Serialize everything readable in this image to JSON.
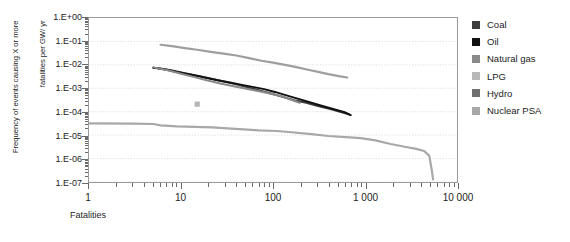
{
  "chart_data": {
    "type": "line",
    "title": "",
    "xlabel": "Fatalities",
    "ylabel": "Frequency of events causing X or more\nfatalities per GW/ yr",
    "xscale": "log",
    "yscale": "log",
    "xlim": [
      1,
      10000
    ],
    "ylim": [
      1e-07,
      1
    ],
    "xticklabels": [
      "1",
      "10",
      "100",
      "1 000",
      "10 000"
    ],
    "xtickvalues": [
      1,
      10,
      100,
      1000,
      10000
    ],
    "yticklabels": [
      "1.E+00",
      "1.E-01",
      "1.E-02",
      "1.E-03",
      "1.E-04",
      "1.E-05",
      "1.E-06",
      "1.E-07"
    ],
    "ytickvalues": [
      1,
      0.1,
      0.01,
      0.001,
      0.0001,
      1e-05,
      1e-06,
      1e-07
    ],
    "grid": true,
    "legend_position": "right",
    "series": [
      {
        "name": "Coal",
        "color": "#3d3d3d",
        "width": 2.0,
        "points": [
          [
            5,
            0.0075
          ],
          [
            6,
            0.007
          ],
          [
            8,
            0.0058
          ],
          [
            11,
            0.0044
          ],
          [
            16,
            0.0033
          ],
          [
            22,
            0.0025
          ],
          [
            30,
            0.0019
          ],
          [
            42,
            0.0014
          ],
          [
            55,
            0.00105
          ],
          [
            70,
            0.00082
          ],
          [
            95,
            0.0006
          ],
          [
            130,
            0.00042
          ],
          [
            170,
            0.00031
          ],
          [
            230,
            0.00024
          ],
          [
            300,
            0.00018
          ],
          [
            420,
            0.00013
          ],
          [
            560,
            9.5e-05
          ],
          [
            680,
            7.5e-05
          ]
        ]
      },
      {
        "name": "Oil",
        "color": "#111111",
        "width": 2.0,
        "points": [
          [
            5,
            0.0076
          ],
          [
            7,
            0.0062
          ],
          [
            9,
            0.005
          ],
          [
            13,
            0.0038
          ],
          [
            18,
            0.0029
          ],
          [
            25,
            0.0022
          ],
          [
            34,
            0.00175
          ],
          [
            46,
            0.0014
          ],
          [
            60,
            0.00115
          ],
          [
            80,
            0.00092
          ],
          [
            105,
            0.0007
          ],
          [
            140,
            0.0005
          ],
          [
            185,
            0.00036
          ],
          [
            245,
            0.00026
          ],
          [
            330,
            0.000185
          ],
          [
            450,
            0.00013
          ],
          [
            600,
            9.5e-05
          ],
          [
            700,
            7.2e-05
          ]
        ]
      },
      {
        "name": "Natural gas",
        "color": "#8a8a8a",
        "width": 2.0,
        "points": [
          [
            5,
            0.0078
          ],
          [
            7,
            0.006
          ],
          [
            10,
            0.0042
          ],
          [
            14,
            0.003
          ],
          [
            19,
            0.0022
          ],
          [
            26,
            0.00165
          ],
          [
            35,
            0.00128
          ],
          [
            48,
            0.001
          ],
          [
            62,
            0.00082
          ],
          [
            80,
            0.00068
          ],
          [
            100,
            0.00056
          ],
          [
            125,
            0.00046
          ],
          [
            150,
            0.00035
          ],
          [
            175,
            0.00028
          ],
          [
            195,
            0.00024
          ]
        ]
      },
      {
        "name": "LPG",
        "color": "#b3b3b3",
        "width": 2.0,
        "marker_only": true,
        "points": [
          [
            15,
            0.00021
          ]
        ]
      },
      {
        "name": "Hydro",
        "color": "#9e9e9e",
        "width": 2.2,
        "points": [
          [
            6,
            0.072
          ],
          [
            8,
            0.063
          ],
          [
            11,
            0.052
          ],
          [
            15,
            0.044
          ],
          [
            21,
            0.036
          ],
          [
            29,
            0.03
          ],
          [
            40,
            0.025
          ],
          [
            55,
            0.0195
          ],
          [
            75,
            0.015
          ],
          [
            100,
            0.0125
          ],
          [
            135,
            0.01
          ],
          [
            180,
            0.008
          ],
          [
            240,
            0.0062
          ],
          [
            310,
            0.005
          ],
          [
            400,
            0.004
          ],
          [
            520,
            0.0033
          ],
          [
            640,
            0.0029
          ]
        ]
      },
      {
        "name": "Nuclear PSA",
        "color": "#a8a8a8",
        "width": 2.2,
        "points": [
          [
            1,
            3.2e-05
          ],
          [
            3,
            3.1e-05
          ],
          [
            5,
            3e-05
          ],
          [
            6,
            2.6e-05
          ],
          [
            9,
            2.35e-05
          ],
          [
            14,
            2.25e-05
          ],
          [
            22,
            2.15e-05
          ],
          [
            32,
            1.95e-05
          ],
          [
            48,
            1.75e-05
          ],
          [
            70,
            1.6e-05
          ],
          [
            110,
            1.5e-05
          ],
          [
            170,
            1.3e-05
          ],
          [
            260,
            1.1e-05
          ],
          [
            400,
            9.2e-06
          ],
          [
            620,
            8.2e-06
          ],
          [
            900,
            7.5e-06
          ],
          [
            1300,
            6e-06
          ],
          [
            1900,
            4.2e-06
          ],
          [
            2700,
            3.2e-06
          ],
          [
            3600,
            2.6e-06
          ],
          [
            4400,
            2.1e-06
          ],
          [
            5000,
            1.3e-06
          ],
          [
            5300,
            3.5e-07
          ],
          [
            5500,
            1.3e-07
          ]
        ]
      }
    ]
  },
  "axes": {
    "y_title_line1": "Frequency of events causing X or more",
    "y_title_line2": "fatalities per GW/ yr",
    "x_title": "Fatalities"
  },
  "legend": {
    "items": [
      {
        "label": "Coal",
        "color": "#3d3d3d"
      },
      {
        "label": "Oil",
        "color": "#111111"
      },
      {
        "label": "Natural gas",
        "color": "#8a8a8a"
      },
      {
        "label": "LPG",
        "color": "#b8b8b8"
      },
      {
        "label": "Hydro",
        "color": "#6f6f6f"
      },
      {
        "label": "Nuclear PSA",
        "color": "#a8a8a8"
      }
    ]
  },
  "top_title": {
    "text": ""
  }
}
